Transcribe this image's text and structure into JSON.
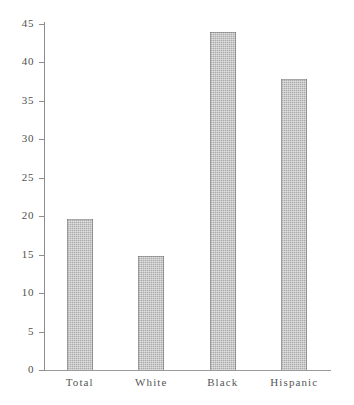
{
  "page_artifact": "",
  "chart_data": {
    "type": "bar",
    "title": "",
    "subtitle": "",
    "xlabel": "",
    "ylabel": "",
    "categories": [
      "Total",
      "White",
      "Black",
      "Hispanic"
    ],
    "values": [
      19.7,
      14.8,
      44.0,
      37.9
    ],
    "series": [
      {
        "name": "",
        "values": [
          19.7,
          14.8,
          44.0,
          37.9
        ]
      }
    ],
    "ylim": [
      0,
      45
    ],
    "yticks": [
      0,
      5,
      10,
      15,
      20,
      25,
      30,
      35,
      40,
      45
    ],
    "ytick_labels": [
      "0",
      "5",
      "10",
      "15",
      "20",
      "25",
      "30",
      "35",
      "40",
      "45"
    ],
    "grid": false,
    "legend": null,
    "legend_position": "none",
    "annotations": [],
    "bar_color": "#ababab",
    "bar_edge_color": "#6e6e6e",
    "axis_color": "#8e8e8e",
    "text_color": "#4f4f4f",
    "background_color": "#ffffff"
  }
}
